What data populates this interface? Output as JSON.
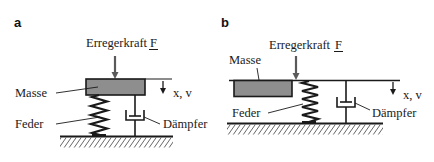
{
  "colors": {
    "line": "#1a1a1a",
    "mass_fill": "#8e8e8e",
    "background": "#ffffff"
  },
  "panels": [
    {
      "id": "a",
      "label": "a",
      "force_label": "Erregerkraft",
      "force_symbol": "F",
      "mass_label": "Masse",
      "spring_label": "Feder",
      "damper_label": "Dämpfer",
      "displacement_label": "x, v"
    },
    {
      "id": "b",
      "label": "b",
      "force_label": "Erregerkraft",
      "force_symbol": "F",
      "mass_label": "Masse",
      "spring_label": "Feder",
      "damper_label": "Dämpfer",
      "displacement_label": "x, v"
    }
  ]
}
